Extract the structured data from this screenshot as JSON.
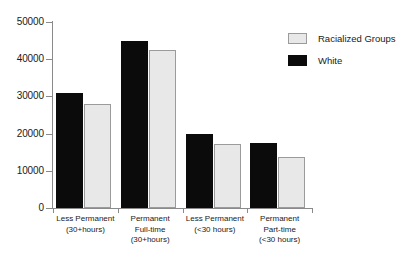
{
  "chart_data": {
    "type": "bar",
    "title": "",
    "subtitle": "",
    "xlabel": "",
    "ylabel": "",
    "ylim": [
      0,
      50000
    ],
    "yticks": [
      0,
      10000,
      20000,
      30000,
      40000,
      50000
    ],
    "ytick_labels": [
      "0",
      "10000",
      "20000",
      "30000",
      "40000",
      "50000"
    ],
    "grid": false,
    "legend_position": "top-right",
    "categories": [
      "Less Permanent (30+hours)",
      "Permanent Full-time (30+hours)",
      "Less Permanent (<30 hours)",
      "Permanent Part-time (<30 hours)"
    ],
    "category_lines": [
      [
        "Less Permanent",
        "(30+hours)"
      ],
      [
        "Permanent",
        "Full-time",
        "(30+hours)"
      ],
      [
        "Less Permanent",
        "(<30 hours)"
      ],
      [
        "Permanent",
        "Part-time",
        "(<30 hours)"
      ]
    ],
    "series": [
      {
        "name": "White",
        "color": "#0b0b0b",
        "values": [
          30800,
          44900,
          19800,
          17500
        ]
      },
      {
        "name": "Racialized Groups",
        "color": "#e8e8e8",
        "values": [
          27900,
          42400,
          17200,
          13800
        ]
      }
    ]
  },
  "legend": {
    "entries": [
      {
        "label": "Racialized Groups",
        "swatch": "racialized"
      },
      {
        "label": "White",
        "swatch": "white"
      }
    ]
  }
}
